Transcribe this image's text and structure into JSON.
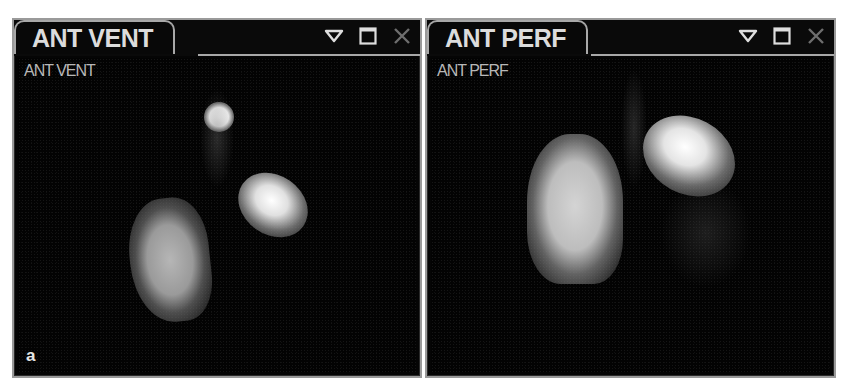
{
  "panels": [
    {
      "tab_label": "ANT VENT",
      "overlay_label": "ANT VENT",
      "figure_letter": "a",
      "controls": {
        "dropdown_icon": "triangle-down-icon",
        "maximize_icon": "maximize-icon",
        "close_icon": "close-icon"
      }
    },
    {
      "tab_label": "ANT PERF",
      "overlay_label": "ANT PERF",
      "controls": {
        "dropdown_icon": "triangle-down-icon",
        "maximize_icon": "maximize-icon",
        "close_icon": "close-icon"
      }
    }
  ],
  "colors": {
    "background": "#050505",
    "border": "#a8a8a8",
    "label_text": "#dcdcdc"
  }
}
